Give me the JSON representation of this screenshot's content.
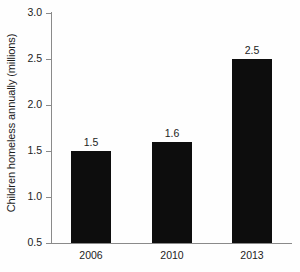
{
  "chart_data": {
    "type": "bar",
    "title": "",
    "subtitle": "",
    "xlabel": "",
    "ylabel": "Children homeless annually (millions)",
    "categories": [
      "2006",
      "2010",
      "2013"
    ],
    "values": [
      1.5,
      1.6,
      2.5
    ],
    "value_labels": [
      "1.5",
      "1.6",
      "2.5"
    ],
    "ylim": [
      0.5,
      3.0
    ],
    "ytick_values": [
      0.5,
      1.0,
      1.5,
      2.0,
      2.5,
      3.0
    ],
    "ytick_labels": [
      "0.5",
      "1.0",
      "1.5",
      "2.0",
      "2.5",
      "3.0"
    ],
    "grid": false,
    "legend": false,
    "legend_position": "none",
    "bar_color": "#0d0d0d",
    "axis_color": "#8a8a8a",
    "text_color": "#1c1c1c",
    "background_color": "#fefefe"
  }
}
